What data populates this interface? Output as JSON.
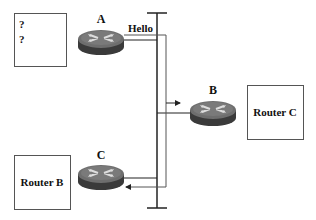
{
  "routers": [
    {
      "id": "A",
      "label": "A"
    },
    {
      "id": "B",
      "label": "B"
    },
    {
      "id": "C",
      "label": "C"
    }
  ],
  "boxes": {
    "unknown": {
      "lines": [
        "?",
        "?"
      ]
    },
    "router_c_box": {
      "label": "Router C"
    },
    "router_b_box": {
      "label": "Router B"
    }
  },
  "messages": {
    "hello": "Hello"
  },
  "colors": {
    "line": "#222222",
    "box_border": "#555555",
    "router_top": "#6b6b6b",
    "router_side": "#3a3a3a"
  }
}
